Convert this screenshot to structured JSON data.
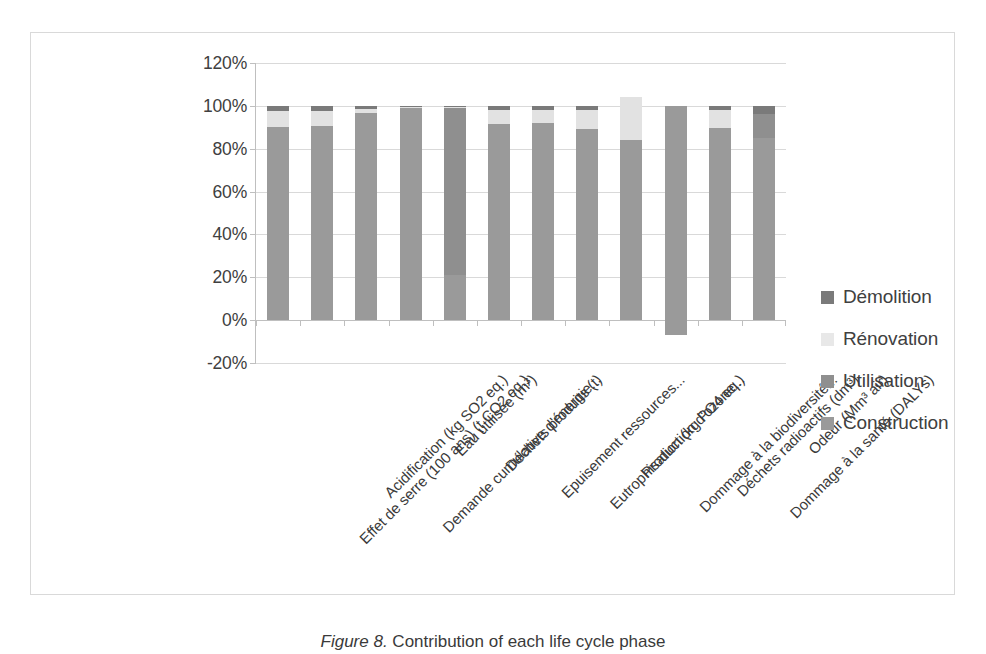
{
  "caption": {
    "figure_number": "Figure 8.",
    "text": "Contribution of each life cycle phase"
  },
  "chart_data": {
    "type": "bar",
    "subtype": "stacked-bar-100",
    "title": "",
    "xlabel": "",
    "ylabel": "",
    "ylim": [
      -20,
      120
    ],
    "yticks": [
      "-20%",
      "0%",
      "20%",
      "40%",
      "60%",
      "80%",
      "100%",
      "120%"
    ],
    "ytick_values": [
      -20,
      0,
      20,
      40,
      60,
      80,
      100,
      120
    ],
    "grid": true,
    "legend_position": "right",
    "categories": [
      "Effet de serre (100 ans) (t CO2 eq.)",
      "Acidification (kg SO2 eq.)",
      "Demande cumulative d'énergie...",
      "Eau utilisée (m³)",
      "Déchets produits (t)",
      "Epuisement ressources...",
      "Eutrophisation (kg PO4 eq.)",
      "Production d'ozone...",
      "Dommage à la biodiversité...",
      "Déchets radioactifs (dm³)",
      "Dommage à la santé (DALYs)",
      "Odeur (Mm³ air)"
    ],
    "series": [
      {
        "name": "Construction",
        "color": "#9a9a9a",
        "values": [
          90,
          90.5,
          96.5,
          99,
          21,
          91.5,
          92,
          89,
          84,
          100,
          89.5,
          85
        ]
      },
      {
        "name": "Utilisation",
        "color": "#8f8f8f",
        "values": [
          0,
          0,
          0,
          0,
          78,
          0,
          0,
          0,
          0,
          0,
          0,
          11
        ]
      },
      {
        "name": "Rénovation",
        "color": "#e2e2e2",
        "values": [
          7.5,
          7,
          2,
          0.5,
          0.5,
          6.5,
          6,
          9,
          20,
          0,
          8.5,
          0
        ]
      },
      {
        "name": "Démolition",
        "color": "#7a7a7a",
        "values": [
          2.5,
          2.5,
          1.5,
          0.5,
          0.5,
          2,
          2,
          2,
          0,
          0,
          2,
          4
        ]
      }
    ],
    "negative_values": [
      {
        "category": "Déchets radioactifs (dm³)",
        "series": "Construction",
        "value": -7
      }
    ]
  },
  "legend": {
    "items": [
      {
        "label": "Démolition",
        "color": "#7a7a7a"
      },
      {
        "label": "Rénovation",
        "color": "#e8e8e8"
      },
      {
        "label": "Utilisation",
        "color": "#8f8f8f"
      },
      {
        "label": "Construction",
        "color": "#9a9a9a"
      }
    ]
  },
  "colors": {
    "grid": "#d9d9d9",
    "axis": "#bfbfbf",
    "text": "#3a3a3a",
    "background": "#ffffff"
  }
}
